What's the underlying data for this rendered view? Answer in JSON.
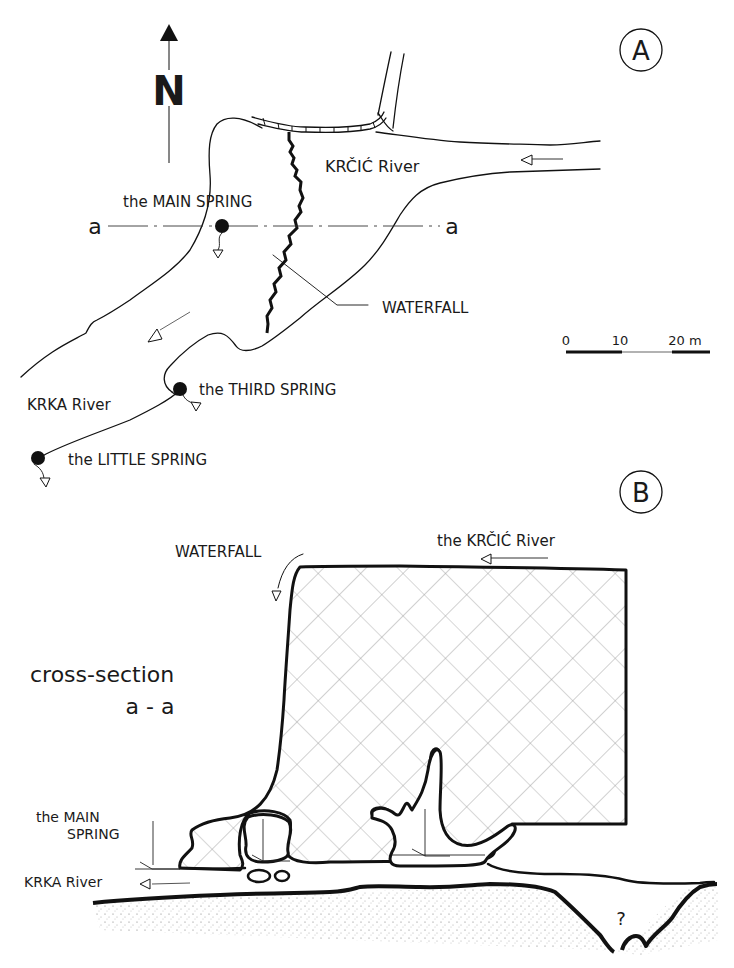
{
  "panel_a": {
    "badge": "A",
    "north_label": "N",
    "section_mark_left": "a",
    "section_mark_right": "a",
    "labels": {
      "main_spring": "the MAIN SPRING",
      "krcic_river": "KRČIĆ River",
      "waterfall": "WATERFALL",
      "krka_river": "KRKA River",
      "third_spring": "the THIRD SPRING",
      "little_spring": "the LITTLE SPRING"
    },
    "scale_bar": {
      "ticks": [
        "0",
        "10",
        "20 m"
      ]
    }
  },
  "panel_b": {
    "badge": "B",
    "title_line1": "cross-section",
    "title_line2": "a - a",
    "labels": {
      "waterfall": "WATERFALL",
      "krcic_river": "the KRČIĆ River",
      "main_spring_line1": "the MAIN",
      "main_spring_line2": "SPRING",
      "krka_river": "KRKA River",
      "unknown": "?"
    }
  },
  "colors": {
    "ink": "#111111",
    "hatch": "#8a8a8a",
    "background": "#ffffff"
  }
}
